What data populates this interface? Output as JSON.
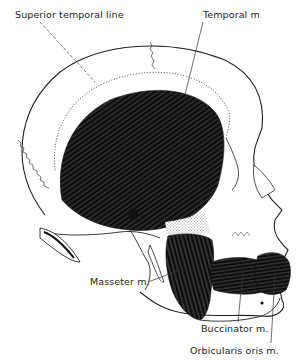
{
  "figure": {
    "colors": {
      "ink": "#111111",
      "background": "#ffffff",
      "muscle_fill": "#0d0d0d",
      "bone_outline": "#222222"
    },
    "labels": [
      {
        "id": "superior-temporal-line",
        "text": "Superior temporal line"
      },
      {
        "id": "temporal-muscle",
        "text": "Temporal m"
      },
      {
        "id": "masseter-muscle",
        "text": "Masseter m."
      },
      {
        "id": "buccinator-muscle",
        "text": "Buccinator m."
      },
      {
        "id": "orbicularis-oris-muscle",
        "text": "Orbicularis oris m."
      }
    ]
  }
}
